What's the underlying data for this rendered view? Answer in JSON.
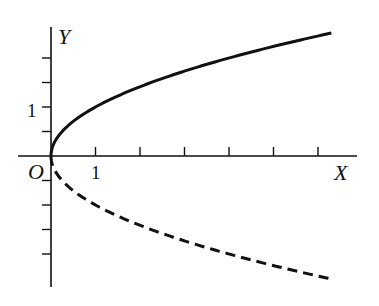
{
  "chart_data": {
    "type": "line",
    "title": "",
    "xlabel": "X",
    "ylabel": "Y",
    "origin_label": "O",
    "x_tick_labels": [
      {
        "value": 1,
        "label": "1"
      }
    ],
    "y_tick_labels": [
      {
        "value": 1,
        "label": "1"
      }
    ],
    "x_ticks": [
      1,
      2,
      3,
      4,
      5,
      6
    ],
    "y_ticks": [
      -2,
      -1.5,
      -1,
      -0.5,
      0.5,
      1,
      1.5,
      2
    ],
    "xlim": [
      -0.75,
      6.9
    ],
    "ylim": [
      -2.8,
      2.8
    ],
    "grid": false,
    "legend": null,
    "series": [
      {
        "name": "upper branch y = √x",
        "style": "solid",
        "x": [
          0,
          0.25,
          0.5,
          1,
          2,
          3,
          4,
          5,
          6.3
        ],
        "y": [
          0,
          0.5,
          0.71,
          1,
          1.41,
          1.73,
          2,
          2.24,
          2.51
        ]
      },
      {
        "name": "lower branch y = −√x",
        "style": "dashed",
        "x": [
          0,
          0.25,
          0.5,
          1,
          2,
          3,
          4,
          5,
          6.3
        ],
        "y": [
          0,
          -0.5,
          -0.71,
          -1,
          -1.41,
          -1.73,
          -2,
          -2.24,
          -2.51
        ]
      }
    ]
  },
  "colors": {
    "ink": "#111111",
    "background": "#ffffff"
  }
}
